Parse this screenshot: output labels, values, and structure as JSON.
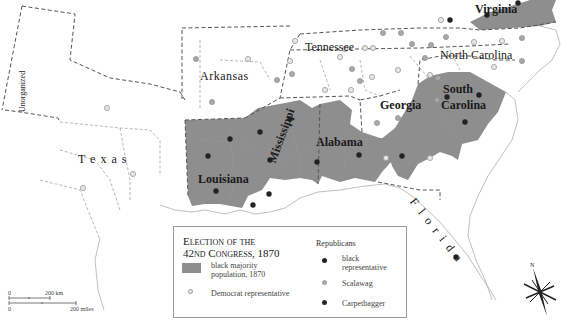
{
  "map": {
    "colors": {
      "background": "#ffffff",
      "black_majority_fill": "#8e8e8e",
      "state_border": "#555555",
      "county_border": "#9a9a9a",
      "coast": "#b0b0b0",
      "democrat_dot": "#d8d8d8",
      "scalawag_dot": "#a8a8a8",
      "black_rep_dot": "#222222",
      "carpetbagger_dot": "#2a2a2a"
    },
    "labels": {
      "unorganized": "Unorganized",
      "texas": "T e x a s",
      "arkansas": "Arkansas",
      "tennessee": "Tennessee",
      "north_carolina": "North Carolina",
      "virginia": "Virginia",
      "louisiana": "Louisiana",
      "mississippi": "Mississippi",
      "alabama": "Alabama",
      "georgia": "Georgia",
      "south": "South",
      "carolina": "Carolina",
      "florida": "F l o r i d a"
    }
  },
  "legend": {
    "title_line1": "Election of the",
    "title_line2": "42nd Congress, 1870",
    "black_majority_label_1": "black majority",
    "black_majority_label_2": "population, 1870",
    "democrat_label": "Democrat representative",
    "republicans_heading": "Republicans",
    "black_rep_label_1": "black",
    "black_rep_label_2": "representative",
    "scalawag_label": "Scalawag",
    "carpetbagger_label": "Carpetbagger"
  },
  "scale_bar": {
    "km_zero": "0",
    "km_label": "200 km",
    "mi_zero": "0",
    "mi_label": "200 miles"
  },
  "compass": {
    "north_label": "N"
  }
}
